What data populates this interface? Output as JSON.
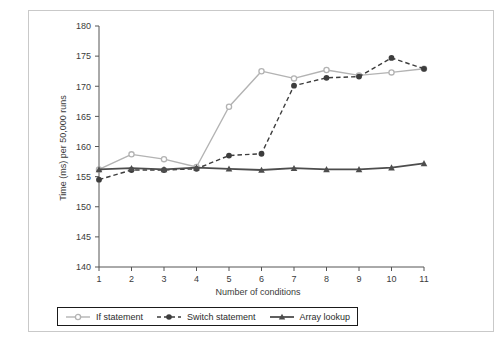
{
  "chart_data": {
    "type": "line",
    "title": "",
    "xlabel": "Number of conditions",
    "ylabel": "Time (ms) per 50,000 runs",
    "x": [
      1,
      2,
      3,
      4,
      5,
      6,
      7,
      8,
      9,
      10,
      11
    ],
    "xticks": [
      "1",
      "2",
      "3",
      "4",
      "5",
      "6",
      "7",
      "8",
      "9",
      "10",
      "11"
    ],
    "yticks": [
      "140",
      "145",
      "150",
      "155",
      "160",
      "165",
      "170",
      "175",
      "180"
    ],
    "ylim": [
      140,
      180
    ],
    "xlim": [
      1,
      11
    ],
    "grid": false,
    "legend_position": "below-plot",
    "series": [
      {
        "name": "If statement",
        "marker": "circle-open",
        "linestyle": "solid",
        "color": "#b3b3b3",
        "values": [
          156.2,
          158.7,
          157.9,
          156.6,
          166.6,
          172.5,
          171.3,
          172.7,
          171.8,
          172.3,
          172.9
        ]
      },
      {
        "name": "Switch statement",
        "marker": "circle-filled",
        "linestyle": "dashed",
        "color": "#3d3d3d",
        "values": [
          154.5,
          156.1,
          156.1,
          156.3,
          158.5,
          158.8,
          170.1,
          171.4,
          171.6,
          174.7,
          172.9
        ]
      },
      {
        "name": "Array lookup",
        "marker": "triangle-filled",
        "linestyle": "solid",
        "color": "#4d4d4d",
        "values": [
          156.2,
          156.4,
          156.2,
          156.5,
          156.3,
          156.1,
          156.4,
          156.2,
          156.2,
          156.5,
          157.2
        ]
      }
    ]
  },
  "legend": {
    "items": [
      {
        "label": "If statement"
      },
      {
        "label": "Switch statement"
      },
      {
        "label": "Array lookup"
      }
    ]
  },
  "colors": {
    "if_statement": "#b3b3b3",
    "switch_statement": "#3d3d3d",
    "array_lookup": "#4d4d4d",
    "axis": "#555555",
    "frame": "#c9c9c9",
    "text": "#3b3b3b"
  }
}
